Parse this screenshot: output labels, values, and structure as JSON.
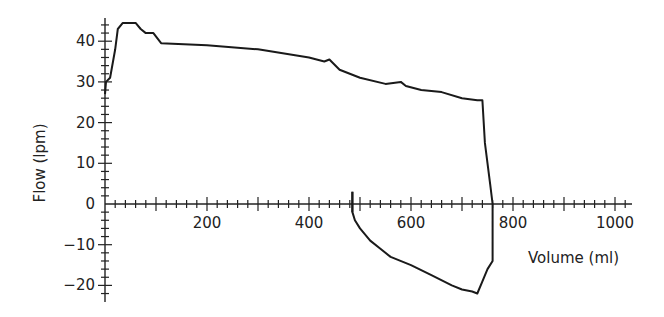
{
  "chart_data": {
    "type": "line",
    "title": "",
    "xlabel": "Volume (ml)",
    "ylabel": "Flow (lpm)",
    "xlim": [
      0,
      1050
    ],
    "ylim": [
      -24,
      45
    ],
    "x_ticks": [
      "200",
      "400",
      "600",
      "800",
      "1000"
    ],
    "y_ticks": [
      "40",
      "30",
      "20",
      "10",
      "0",
      "−10",
      "−20"
    ],
    "grid": false,
    "legend": null,
    "series": [
      {
        "name": "Inspiration",
        "x": [
          0,
          2,
          10,
          20,
          25,
          35,
          60,
          70,
          80,
          95,
          110,
          200,
          300,
          400,
          430,
          440,
          460,
          500,
          550,
          580,
          590,
          620,
          660,
          700,
          730,
          740,
          745,
          755,
          760
        ],
        "y": [
          27,
          30,
          31,
          38,
          43,
          44.5,
          44.5,
          43,
          42,
          42,
          39.5,
          39,
          38,
          36,
          35,
          35.5,
          33,
          31,
          29.5,
          30,
          29,
          28,
          27.5,
          26,
          25.5,
          25.5,
          15,
          5,
          0
        ]
      },
      {
        "name": "Expiration",
        "x": [
          485,
          485,
          490,
          500,
          520,
          540,
          560,
          600,
          640,
          680,
          700,
          720,
          730,
          740,
          750,
          760,
          760
        ],
        "y": [
          3,
          -2,
          -4,
          -6,
          -9,
          -11,
          -13,
          -15,
          -17.5,
          -20,
          -21,
          -21.5,
          -22,
          -19,
          -16,
          -14,
          0
        ]
      }
    ]
  }
}
